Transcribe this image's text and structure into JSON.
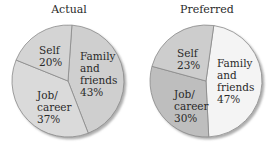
{
  "chart_data": [
    {
      "type": "pie",
      "title": "Actual",
      "categories": [
        "Family and friends",
        "Job/career",
        "Self"
      ],
      "values": [
        43,
        37,
        20
      ],
      "labels": [
        "Family\nand\nfriends\n43%",
        "Job/\ncareer\n37%",
        "Self\n20%"
      ],
      "colors": [
        "#cfcfcf",
        "#dadada",
        "#d4d4d4"
      ]
    },
    {
      "type": "pie",
      "title": "Preferred",
      "categories": [
        "Family and friends",
        "Job/career",
        "Self"
      ],
      "values": [
        47,
        30,
        23
      ],
      "labels": [
        "Family\nand\nfriends\n47%",
        "Job/\ncareer\n30%",
        "Self\n23%"
      ],
      "colors": [
        "#f4f4f4",
        "#bebebe",
        "#cdcdcd"
      ]
    }
  ],
  "actual": {
    "title": "Actual",
    "family": [
      "Family",
      "and",
      "friends",
      "43%"
    ],
    "job": [
      "Job/",
      "career",
      "37%"
    ],
    "self": [
      "Self",
      "20%"
    ]
  },
  "preferred": {
    "title": "Preferred",
    "family": [
      "Family",
      "and",
      "friends",
      "47%"
    ],
    "job": [
      "Job/",
      "career",
      "30%"
    ],
    "self": [
      "Self",
      "23%"
    ]
  }
}
